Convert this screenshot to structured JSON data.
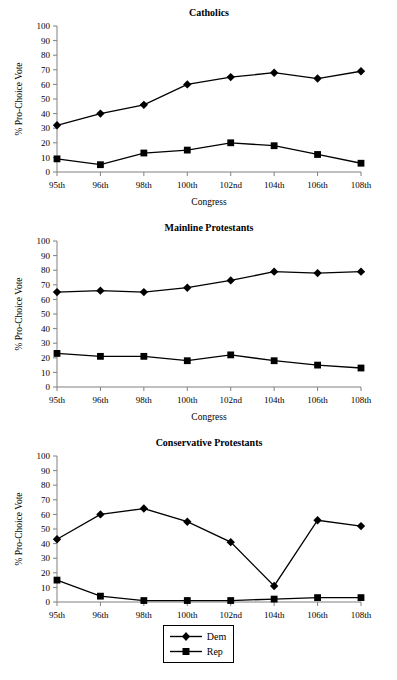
{
  "figure": {
    "y_axis_label": "% Pro-Choice Vote",
    "x_axis_label": "Congress",
    "y_ticks": [
      "0",
      "10",
      "20",
      "30",
      "40",
      "50",
      "60",
      "70",
      "80",
      "90",
      "100"
    ],
    "x_ticks": [
      "95th",
      "96th",
      "98th",
      "100th",
      "102nd",
      "104th",
      "106th",
      "108th"
    ],
    "line_color": "#000000",
    "axis_color": "#808080",
    "background": "#ffffff"
  },
  "legend": {
    "items": [
      {
        "label": "Dem",
        "marker": "diamond"
      },
      {
        "label": "Rep",
        "marker": "square"
      }
    ]
  },
  "chart_data": [
    {
      "type": "line",
      "title": "Catholics",
      "xlabel": "Congress",
      "ylabel": "% Pro-Choice Vote",
      "categories": [
        "95th",
        "96th",
        "98th",
        "100th",
        "102nd",
        "104th",
        "106th",
        "108th"
      ],
      "ylim": [
        0,
        100
      ],
      "ytick_step": 10,
      "grid": false,
      "legend_position": "below-figure",
      "series": [
        {
          "name": "Dem",
          "marker": "diamond",
          "values": [
            32,
            40,
            46,
            60,
            65,
            68,
            64,
            69
          ]
        },
        {
          "name": "Rep",
          "marker": "square",
          "values": [
            9,
            5,
            13,
            15,
            20,
            18,
            12,
            6
          ]
        }
      ]
    },
    {
      "type": "line",
      "title": "Mainline Protestants",
      "xlabel": "Congress",
      "ylabel": "% Pro-Choice Vote",
      "categories": [
        "95th",
        "96th",
        "98th",
        "100th",
        "102nd",
        "104th",
        "106th",
        "108th"
      ],
      "ylim": [
        0,
        100
      ],
      "ytick_step": 10,
      "grid": false,
      "legend_position": "below-figure",
      "series": [
        {
          "name": "Dem",
          "marker": "diamond",
          "values": [
            65,
            66,
            65,
            68,
            73,
            79,
            78,
            79
          ]
        },
        {
          "name": "Rep",
          "marker": "square",
          "values": [
            23,
            21,
            21,
            18,
            22,
            18,
            15,
            13
          ]
        }
      ]
    },
    {
      "type": "line",
      "title": "Conservative Protestants",
      "xlabel": "Congress",
      "ylabel": "% Pro-Choice Vote",
      "categories": [
        "95th",
        "96th",
        "98th",
        "100th",
        "102nd",
        "104th",
        "106th",
        "108th"
      ],
      "ylim": [
        0,
        100
      ],
      "ytick_step": 10,
      "grid": false,
      "legend_position": "below-figure",
      "series": [
        {
          "name": "Dem",
          "marker": "diamond",
          "values": [
            43,
            60,
            64,
            55,
            41,
            11,
            56,
            52
          ]
        },
        {
          "name": "Rep",
          "marker": "square",
          "values": [
            15,
            4,
            1,
            1,
            1,
            2,
            3,
            3
          ]
        }
      ]
    }
  ]
}
